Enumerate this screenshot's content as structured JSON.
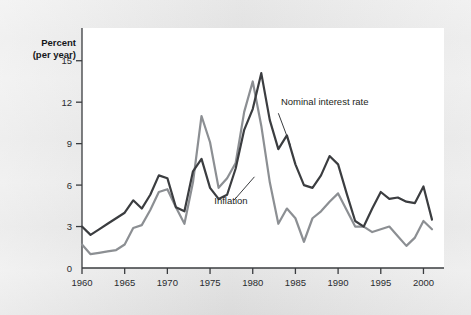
{
  "figure": {
    "axis_title_line1": "Percent",
    "axis_title_line2": "(per year)",
    "plot_background": "#ffffff",
    "page_background": "#e9e9e9"
  },
  "annotations": [
    {
      "name": "nominal-interest-rate",
      "text": "Nominal interest rate"
    },
    {
      "name": "inflation",
      "text": "Inflation"
    }
  ],
  "chart_data": {
    "type": "line",
    "title": "",
    "subtitle": "",
    "xlabel": "",
    "ylabel": "Percent (per year)",
    "xlim": [
      1960,
      2001
    ],
    "ylim": [
      0,
      16.5
    ],
    "xticks": [
      1960,
      1965,
      1970,
      1975,
      1980,
      1985,
      1990,
      1995,
      2000
    ],
    "xtick_labels": [
      "1960",
      "1965",
      "1970",
      "1975",
      "1980",
      "1985",
      "1990",
      "1995",
      "2000"
    ],
    "yticks": [
      0,
      3,
      6,
      9,
      12,
      15
    ],
    "ytick_labels": [
      "0",
      "3",
      "6",
      "9",
      "12",
      "15"
    ],
    "grid": false,
    "legend": "annotated-inline",
    "x": [
      1960,
      1961,
      1962,
      1963,
      1964,
      1965,
      1966,
      1967,
      1968,
      1969,
      1970,
      1971,
      1972,
      1973,
      1974,
      1975,
      1976,
      1977,
      1978,
      1979,
      1980,
      1981,
      1982,
      1983,
      1984,
      1985,
      1986,
      1987,
      1988,
      1989,
      1990,
      1991,
      1992,
      1993,
      1994,
      1995,
      1996,
      1997,
      1998,
      1999,
      2000,
      2001
    ],
    "series": [
      {
        "name": "Nominal interest rate",
        "color": "#3b3d40",
        "linewidth": 2.2,
        "values": [
          3.0,
          2.4,
          2.8,
          3.2,
          3.6,
          4.0,
          4.9,
          4.3,
          5.3,
          6.7,
          6.5,
          4.4,
          4.1,
          7.0,
          7.9,
          5.8,
          5.0,
          5.3,
          7.2,
          10.0,
          11.5,
          14.1,
          10.7,
          8.6,
          9.6,
          7.5,
          6.0,
          5.8,
          6.7,
          8.1,
          7.5,
          5.4,
          3.4,
          3.0,
          4.3,
          5.5,
          5.0,
          5.1,
          4.8,
          4.7,
          5.9,
          3.5
        ]
      },
      {
        "name": "Inflation",
        "color": "#8c8f93",
        "linewidth": 2.2,
        "values": [
          1.7,
          1.0,
          1.1,
          1.2,
          1.3,
          1.7,
          2.9,
          3.1,
          4.2,
          5.5,
          5.7,
          4.4,
          3.2,
          6.2,
          11.0,
          9.1,
          5.8,
          6.5,
          7.6,
          11.3,
          13.5,
          10.3,
          6.2,
          3.2,
          4.3,
          3.6,
          1.9,
          3.6,
          4.1,
          4.8,
          5.4,
          4.2,
          3.0,
          3.0,
          2.6,
          2.8,
          3.0,
          2.3,
          1.6,
          2.2,
          3.4,
          2.8
        ]
      }
    ],
    "annotations": [
      {
        "text": "Nominal interest rate",
        "label_x": 1983.3,
        "label_y": 11.8,
        "leader_from_x": 1983.0,
        "leader_from_y": 11.2,
        "leader_to_x": 1984.4,
        "leader_to_y": 8.9
      },
      {
        "text": "Inflation",
        "label_x": 1975.5,
        "label_y": 4.6,
        "leader_from_x": 1977.8,
        "leader_from_y": 4.9,
        "leader_to_x": 1980.2,
        "leader_to_y": 6.6
      }
    ]
  }
}
